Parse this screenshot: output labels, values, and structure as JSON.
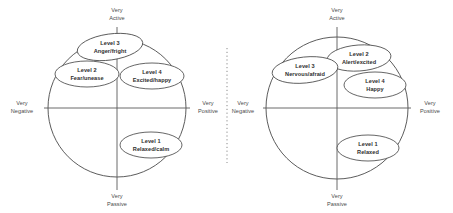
{
  "figure": {
    "background_color": "#ffffff",
    "stroke_color": "#4a4a4a",
    "text_color": "#2e2e2e",
    "axis_text_color": "#4a4a4a",
    "divider": {
      "style": "vertical-dotted-line",
      "color": "#8a8a8a"
    }
  },
  "diagrams": [
    {
      "id": "left",
      "name": "valence-arousal-circumplex-left",
      "axes": {
        "top": "Very\nActive",
        "top_line1": "Very",
        "top_line2": "Active",
        "bottom_line1": "Very",
        "bottom_line2": "Passive",
        "left_line1": "Very",
        "left_line2": "Negative",
        "right_line1": "Very",
        "right_line2": "Positive"
      },
      "bubbles": [
        {
          "id": "left-level-3",
          "level": "Level 3",
          "emotion": "Anger/fright",
          "quadrant": "negative-active"
        },
        {
          "id": "left-level-2",
          "level": "Level 2",
          "emotion": "Fear/unease",
          "quadrant": "negative-active"
        },
        {
          "id": "left-level-4",
          "level": "Level 4",
          "emotion": "Excited/happy",
          "quadrant": "positive-active"
        },
        {
          "id": "left-level-1",
          "level": "Level 1",
          "emotion": "Relaxed/calm",
          "quadrant": "positive-passive"
        }
      ]
    },
    {
      "id": "right",
      "name": "valence-arousal-circumplex-right",
      "axes": {
        "top_line1": "Very",
        "top_line2": "Active",
        "bottom_line1": "Very",
        "bottom_line2": "Passive",
        "left_line1": "Very",
        "left_line2": "Negative",
        "right_line1": "Very",
        "right_line2": "Positive"
      },
      "bubbles": [
        {
          "id": "right-level-3",
          "level": "Level 3",
          "emotion": "Nervous/afraid",
          "quadrant": "negative-active"
        },
        {
          "id": "right-level-2",
          "level": "Level 2",
          "emotion": "Alert/excited",
          "quadrant": "positive-active"
        },
        {
          "id": "right-level-4",
          "level": "Level 4",
          "emotion": "Happy",
          "quadrant": "positive-active"
        },
        {
          "id": "right-level-1",
          "level": "Level 1",
          "emotion": "Relaxed",
          "quadrant": "positive-passive"
        }
      ]
    }
  ]
}
